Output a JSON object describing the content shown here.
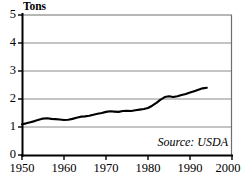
{
  "chart_data": {
    "type": "line",
    "title": "",
    "subtitle": "",
    "xlabel": "",
    "ylabel": "Tons",
    "unit_label": "Tons",
    "xlim": [
      1950,
      2000
    ],
    "ylim": [
      0,
      5
    ],
    "grid": true,
    "grid_axis": "y",
    "legend": false,
    "legend_position": "none",
    "line_color": "#000000",
    "axis_color": "#000000",
    "grid_color": "#808080",
    "background_color": "#ffffff",
    "annotation": "Source: USDA",
    "annotations": [
      {
        "text": "Source: USDA",
        "x": 1993,
        "y": 0.45,
        "style": "italic",
        "align": "right"
      }
    ],
    "yticks": [
      0,
      1,
      2,
      3,
      4,
      5
    ],
    "ytick_labels": [
      "0",
      "1",
      "2",
      "3",
      "4",
      "5"
    ],
    "xticks": [
      1950,
      1960,
      1970,
      1980,
      1990,
      2000
    ],
    "xtick_labels": [
      "1950",
      "1960",
      "1970",
      "1980",
      "1990",
      "2000"
    ],
    "series": [
      {
        "name": "Tons",
        "x": [
          1950,
          1951,
          1952,
          1953,
          1954,
          1955,
          1956,
          1957,
          1958,
          1959,
          1960,
          1961,
          1962,
          1963,
          1964,
          1965,
          1966,
          1967,
          1968,
          1969,
          1970,
          1971,
          1972,
          1973,
          1974,
          1975,
          1976,
          1977,
          1978,
          1979,
          1980,
          1981,
          1982,
          1983,
          1984,
          1985,
          1986,
          1987,
          1988,
          1989,
          1990,
          1991,
          1992,
          1993,
          1994
        ],
        "values": [
          1.1,
          1.13,
          1.17,
          1.21,
          1.26,
          1.3,
          1.31,
          1.29,
          1.28,
          1.27,
          1.25,
          1.26,
          1.29,
          1.33,
          1.37,
          1.38,
          1.4,
          1.44,
          1.47,
          1.5,
          1.54,
          1.56,
          1.55,
          1.54,
          1.57,
          1.58,
          1.57,
          1.6,
          1.62,
          1.64,
          1.68,
          1.76,
          1.86,
          1.98,
          2.07,
          2.1,
          2.07,
          2.1,
          2.14,
          2.18,
          2.23,
          2.28,
          2.33,
          2.38,
          2.4
        ]
      }
    ]
  },
  "axes": {
    "y_unit": "Tons",
    "y_labels": [
      "5",
      "4",
      "3",
      "2",
      "1",
      "0"
    ],
    "x_labels": [
      "1950",
      "1960",
      "1970",
      "1980",
      "1990",
      "2000"
    ]
  },
  "source": {
    "text": "Source: USDA"
  }
}
